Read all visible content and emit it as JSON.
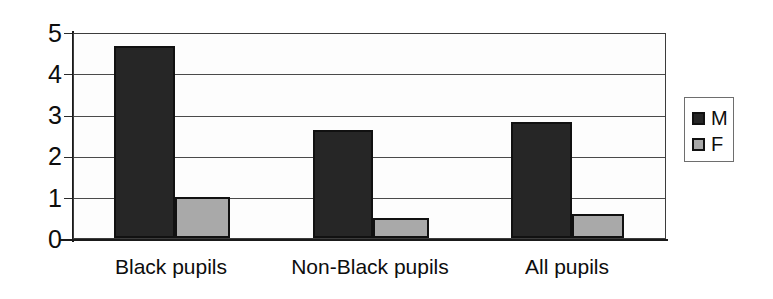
{
  "chart_data": {
    "type": "bar",
    "title": "",
    "subtitle": "",
    "xlabel": "",
    "ylabel": "",
    "ylim": [
      0,
      5
    ],
    "yticks": [
      "0",
      "1",
      "2",
      "3",
      "4",
      "5"
    ],
    "grid": true,
    "grid_axis": "y",
    "legend_position": "right",
    "categories": [
      "Black pupils",
      "Non-Black pupils",
      "All pupils"
    ],
    "series": [
      {
        "name": "M",
        "color": "#262626",
        "values": [
          4.7,
          2.65,
          2.85
        ]
      },
      {
        "name": "F",
        "color": "#a9a9a9",
        "values": [
          1.0,
          0.5,
          0.6
        ]
      }
    ]
  },
  "axis": {
    "y_tick_labels": [
      "5",
      "4",
      "3",
      "2",
      "1",
      "0"
    ]
  },
  "legend": {
    "entries": [
      {
        "label": "M",
        "swatch": "legend-swatch-dark"
      },
      {
        "label": "F",
        "swatch": "legend-swatch-gray"
      }
    ]
  }
}
